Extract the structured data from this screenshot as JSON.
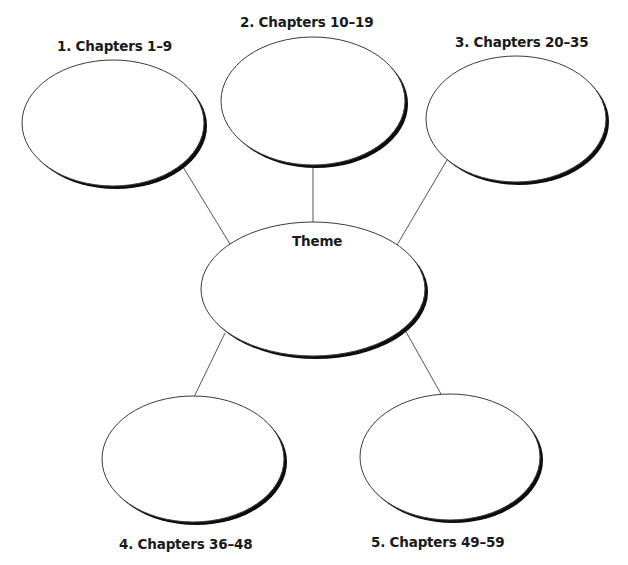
{
  "diagram": {
    "type": "web-organizer",
    "center": {
      "label": "Theme",
      "cx": 313,
      "cy": 289,
      "rx": 112,
      "ry": 67
    },
    "nodes": [
      {
        "label": "1. Chapters 1–9",
        "cx": 113,
        "cy": 123,
        "rx": 91,
        "ry": 63
      },
      {
        "label": "2. Chapters 10–19",
        "cx": 313,
        "cy": 101,
        "rx": 92,
        "ry": 64
      },
      {
        "label": "3. Chapters 20–35",
        "cx": 516,
        "cy": 119,
        "rx": 90,
        "ry": 63
      },
      {
        "label": "4. Chapters 36–48",
        "cx": 193,
        "cy": 459,
        "rx": 91,
        "ry": 63
      },
      {
        "label": "5. Chapters 49–59",
        "cx": 450,
        "cy": 457,
        "rx": 90,
        "ry": 63
      }
    ],
    "connectors": [
      {
        "from": "node-1",
        "to": "center",
        "x1": 183,
        "y1": 167,
        "x2": 230,
        "y2": 244
      },
      {
        "from": "node-2",
        "to": "center",
        "x1": 313,
        "y1": 165,
        "x2": 313,
        "y2": 222
      },
      {
        "from": "node-3",
        "to": "center",
        "x1": 447,
        "y1": 160,
        "x2": 397,
        "y2": 245
      },
      {
        "from": "center",
        "to": "node-4",
        "x1": 225,
        "y1": 333,
        "x2": 194,
        "y2": 397
      },
      {
        "from": "center",
        "to": "node-5",
        "x1": 405,
        "y1": 330,
        "x2": 441,
        "y2": 394
      }
    ],
    "colors": {
      "outline": "#3a3a3a",
      "shadow": "#0d0d0d",
      "connector": "#555555",
      "text": "#1a1a1a",
      "background": "#ffffff"
    }
  }
}
